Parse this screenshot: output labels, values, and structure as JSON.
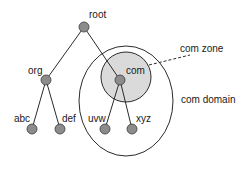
{
  "diagram": {
    "colors": {
      "node_fill": "#8c8c8c",
      "node_stroke": "#3a3a3a",
      "edge": "#2b2b2b",
      "zone_fill": "#dadada",
      "zone_stroke": "#2b2b2b",
      "domain_stroke": "#2b2b2b",
      "text": "#1a1a1a"
    },
    "nodes": [
      {
        "id": "root",
        "label": "root",
        "x": 84,
        "y": 27,
        "lx": 89,
        "ly": 18
      },
      {
        "id": "org",
        "label": "org",
        "x": 46,
        "y": 80,
        "lx": 28,
        "ly": 74
      },
      {
        "id": "com",
        "label": "com",
        "x": 120,
        "y": 80,
        "lx": 126,
        "ly": 74
      },
      {
        "id": "abc",
        "label": "abc",
        "x": 32,
        "y": 129,
        "lx": 14,
        "ly": 122
      },
      {
        "id": "def",
        "label": "def",
        "x": 60,
        "y": 129,
        "lx": 62,
        "ly": 122
      },
      {
        "id": "uvw",
        "label": "uvw",
        "x": 105,
        "y": 129,
        "lx": 88,
        "ly": 122
      },
      {
        "id": "xyz",
        "label": "xyz",
        "x": 132,
        "y": 129,
        "lx": 136,
        "ly": 122
      }
    ],
    "edges": [
      {
        "from": "root",
        "to": "org"
      },
      {
        "from": "root",
        "to": "com"
      },
      {
        "from": "org",
        "to": "abc"
      },
      {
        "from": "org",
        "to": "def"
      },
      {
        "from": "com",
        "to": "uvw"
      },
      {
        "from": "com",
        "to": "xyz"
      }
    ],
    "zone": {
      "label": "com zone",
      "cx": 126,
      "cy": 77,
      "r": 25,
      "lx": 180,
      "ly": 52
    },
    "domain": {
      "label": "com domain",
      "cx": 126,
      "cy": 101,
      "rx": 47,
      "ry": 55,
      "lx": 181,
      "ly": 103
    },
    "callout": {
      "x1": 149,
      "y1": 65,
      "x2": 190,
      "y2": 55
    }
  }
}
